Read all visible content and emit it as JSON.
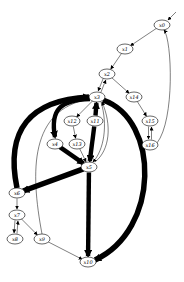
{
  "diagram": {
    "type": "directed-graph",
    "nodes": [
      {
        "id": "x0",
        "label": "x0",
        "x": 162,
        "y": 25
      },
      {
        "id": "x1",
        "label": "x1",
        "x": 125,
        "y": 49
      },
      {
        "id": "x2",
        "label": "x2",
        "x": 107,
        "y": 74
      },
      {
        "id": "x3",
        "label": "x3",
        "x": 97,
        "y": 97
      },
      {
        "id": "x14",
        "label": "x14",
        "x": 134,
        "y": 97
      },
      {
        "id": "x12",
        "label": "x12",
        "x": 72,
        "y": 121
      },
      {
        "id": "x11",
        "label": "x11",
        "x": 95,
        "y": 121
      },
      {
        "id": "x15",
        "label": "x15",
        "x": 150,
        "y": 121
      },
      {
        "id": "x4",
        "label": "x4",
        "x": 55,
        "y": 144
      },
      {
        "id": "x13",
        "label": "x13",
        "x": 77,
        "y": 144
      },
      {
        "id": "x16",
        "label": "x16",
        "x": 150,
        "y": 145
      },
      {
        "id": "x5",
        "label": "x5",
        "x": 89,
        "y": 167
      },
      {
        "id": "x6",
        "label": "x6",
        "x": 17,
        "y": 193
      },
      {
        "id": "x7",
        "label": "x7",
        "x": 17,
        "y": 215
      },
      {
        "id": "x8",
        "label": "x8",
        "x": 15,
        "y": 239
      },
      {
        "id": "x9",
        "label": "x9",
        "x": 42,
        "y": 239
      },
      {
        "id": "x10",
        "label": "x10",
        "x": 88,
        "y": 262
      }
    ],
    "edges": [
      {
        "from": "x0",
        "to": "x1",
        "weight": 1
      },
      {
        "from": "x1",
        "to": "x2",
        "weight": 1
      },
      {
        "from": "x2",
        "to": "x3",
        "weight": 1
      },
      {
        "from": "x3",
        "to": "x2",
        "weight": 1
      },
      {
        "from": "x2",
        "to": "x14",
        "weight": 1
      },
      {
        "from": "x14",
        "to": "x15",
        "weight": 1
      },
      {
        "from": "x15",
        "to": "x16",
        "weight": 1
      },
      {
        "from": "x16",
        "to": "x15",
        "weight": 1
      },
      {
        "from": "x16",
        "to": "x0",
        "weight": 1
      },
      {
        "from": "x3",
        "to": "x12",
        "weight": 1
      },
      {
        "from": "x3",
        "to": "x4",
        "weight": 4
      },
      {
        "from": "x11",
        "to": "x3",
        "weight": 4
      },
      {
        "from": "x3",
        "to": "x5",
        "weight": 1
      },
      {
        "from": "x5",
        "to": "x3",
        "weight": 1
      },
      {
        "from": "x12",
        "to": "x13",
        "weight": 1
      },
      {
        "from": "x13",
        "to": "x5",
        "weight": 1
      },
      {
        "from": "x4",
        "to": "x5",
        "weight": 4
      },
      {
        "from": "x11",
        "to": "x5",
        "weight": 4
      },
      {
        "from": "x5",
        "to": "x6",
        "weight": 5
      },
      {
        "from": "x6",
        "to": "x3",
        "weight": 5
      },
      {
        "from": "x3",
        "to": "x10",
        "weight": 5
      },
      {
        "from": "x5",
        "to": "x10",
        "weight": 4
      },
      {
        "from": "x6",
        "to": "x7",
        "weight": 1
      },
      {
        "from": "x7",
        "to": "x8",
        "weight": 1
      },
      {
        "from": "x8",
        "to": "x7",
        "weight": 1
      },
      {
        "from": "x7",
        "to": "x9",
        "weight": 1
      },
      {
        "from": "x9",
        "to": "x3",
        "weight": 1
      },
      {
        "from": "x9",
        "to": "x10",
        "weight": 1
      }
    ]
  }
}
